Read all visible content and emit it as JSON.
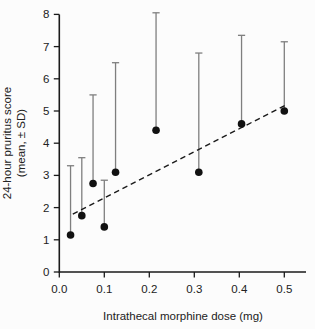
{
  "figure": {
    "background": "#fcfcfc",
    "width": 315,
    "height": 329
  },
  "chart_data": {
    "type": "scatter",
    "title": "",
    "xlabel": "Intrathecal morphine dose (mg)",
    "ylabel_line1": "24-hour pruritus score",
    "ylabel_line2": "(mean, ± SD)",
    "xlim": [
      0,
      0.55
    ],
    "ylim": [
      0,
      8
    ],
    "grid": false,
    "legend": "none",
    "x_ticks": {
      "values": [
        0,
        0.1,
        0.2,
        0.3,
        0.4,
        0.5
      ],
      "labels": [
        "0.0",
        "0.1",
        "0.2",
        "0.3",
        "0.4",
        "0.5"
      ]
    },
    "y_ticks": {
      "values": [
        0,
        1,
        2,
        3,
        4,
        5,
        6,
        7,
        8
      ],
      "labels": [
        "0",
        "1",
        "2",
        "3",
        "4",
        "5",
        "6",
        "7",
        "8"
      ]
    },
    "error_bars": "upper-only",
    "points": [
      {
        "x": 0.025,
        "mean": 1.15,
        "sd": 2.15
      },
      {
        "x": 0.05,
        "mean": 1.75,
        "sd": 1.8
      },
      {
        "x": 0.075,
        "mean": 2.75,
        "sd": 2.75
      },
      {
        "x": 0.1,
        "mean": 1.4,
        "sd": 1.45
      },
      {
        "x": 0.125,
        "mean": 3.1,
        "sd": 3.4
      },
      {
        "x": 0.215,
        "mean": 4.4,
        "sd": 3.65
      },
      {
        "x": 0.31,
        "mean": 3.1,
        "sd": 3.7
      },
      {
        "x": 0.405,
        "mean": 4.6,
        "sd": 2.75
      },
      {
        "x": 0.5,
        "mean": 5.0,
        "sd": 2.15
      }
    ],
    "trend_line": {
      "style": "dashed",
      "x1": 0.03,
      "y1": 1.8,
      "x2": 0.505,
      "y2": 5.2
    },
    "colors": {
      "point": "#111111",
      "error_bar": "#7f7f7f",
      "trend": "#1a1a1a",
      "axis": "#1a1a1a",
      "text": "#222222"
    }
  }
}
